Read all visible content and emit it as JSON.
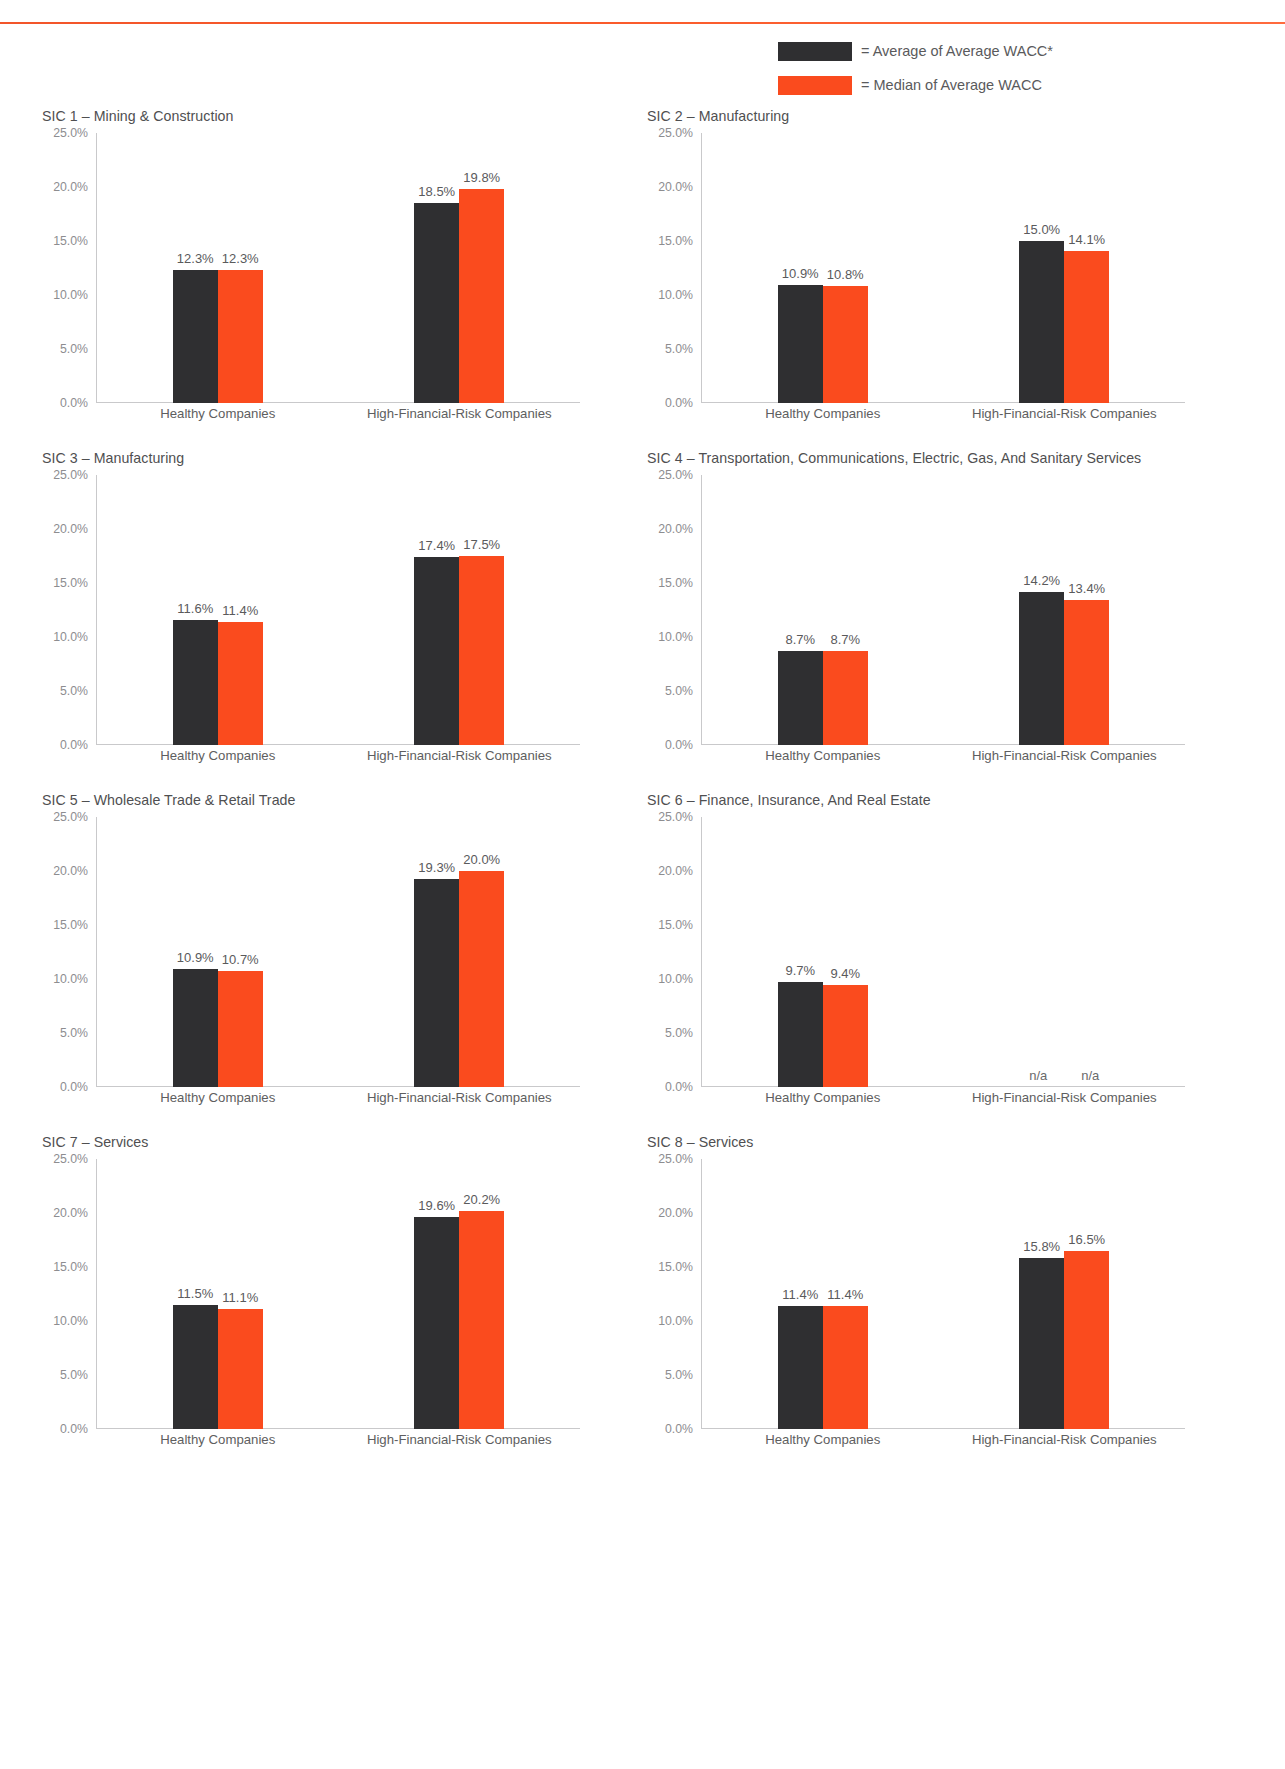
{
  "legend": {
    "items": [
      {
        "swatch": "dark",
        "color": "#2f2f31",
        "label": "= Average of Average WACC*"
      },
      {
        "swatch": "orange",
        "color": "#fa4b1e",
        "label": "= Median of Average WACC"
      }
    ]
  },
  "axis": {
    "yticks": [
      "25.0%",
      "20.0%",
      "15.0%",
      "10.0%",
      "5.0%",
      "0.0%"
    ],
    "ymax": 25.0,
    "ymin": 0.0,
    "categories": [
      "Healthy Companies",
      "High-Financial-Risk Companies"
    ]
  },
  "chart_data": [
    {
      "type": "bar",
      "title": "SIC 1 – Mining & Construction",
      "xlabel": "",
      "ylabel": "",
      "ylim": [
        0,
        25
      ],
      "categories": [
        "Healthy Companies",
        "High-Financial-Risk Companies"
      ],
      "series": [
        {
          "name": "Average of Average WACC*",
          "color": "#2f2f31",
          "values": [
            12.3,
            18.5
          ],
          "labels": [
            "12.3%",
            "18.5%"
          ]
        },
        {
          "name": "Median of Average WACC",
          "color": "#fa4b1e",
          "values": [
            12.3,
            19.8
          ],
          "labels": [
            "12.3%",
            "19.8%"
          ]
        }
      ]
    },
    {
      "type": "bar",
      "title": "SIC 2 – Manufacturing",
      "xlabel": "",
      "ylabel": "",
      "ylim": [
        0,
        25
      ],
      "categories": [
        "Healthy Companies",
        "High-Financial-Risk Companies"
      ],
      "series": [
        {
          "name": "Average of Average WACC*",
          "color": "#2f2f31",
          "values": [
            10.9,
            15.0
          ],
          "labels": [
            "10.9%",
            "15.0%"
          ]
        },
        {
          "name": "Median of Average WACC",
          "color": "#fa4b1e",
          "values": [
            10.8,
            14.1
          ],
          "labels": [
            "10.8%",
            "14.1%"
          ]
        }
      ]
    },
    {
      "type": "bar",
      "title": "SIC 3 – Manufacturing",
      "xlabel": "",
      "ylabel": "",
      "ylim": [
        0,
        25
      ],
      "categories": [
        "Healthy Companies",
        "High-Financial-Risk Companies"
      ],
      "series": [
        {
          "name": "Average of Average WACC*",
          "color": "#2f2f31",
          "values": [
            11.6,
            17.4
          ],
          "labels": [
            "11.6%",
            "17.4%"
          ]
        },
        {
          "name": "Median of Average WACC",
          "color": "#fa4b1e",
          "values": [
            11.4,
            17.5
          ],
          "labels": [
            "11.4%",
            "17.5%"
          ]
        }
      ]
    },
    {
      "type": "bar",
      "title": "SIC 4 – Transportation, Communications, Electric, Gas, And Sanitary Services",
      "xlabel": "",
      "ylabel": "",
      "ylim": [
        0,
        25
      ],
      "categories": [
        "Healthy Companies",
        "High-Financial-Risk Companies"
      ],
      "series": [
        {
          "name": "Average of Average WACC*",
          "color": "#2f2f31",
          "values": [
            8.7,
            14.2
          ],
          "labels": [
            "8.7%",
            "14.2%"
          ]
        },
        {
          "name": "Median of Average WACC",
          "color": "#fa4b1e",
          "values": [
            8.7,
            13.4
          ],
          "labels": [
            "8.7%",
            "13.4%"
          ]
        }
      ]
    },
    {
      "type": "bar",
      "title": "SIC 5 – Wholesale Trade & Retail Trade",
      "xlabel": "",
      "ylabel": "",
      "ylim": [
        0,
        25
      ],
      "categories": [
        "Healthy Companies",
        "High-Financial-Risk Companies"
      ],
      "series": [
        {
          "name": "Average of Average WACC*",
          "color": "#2f2f31",
          "values": [
            10.9,
            19.3
          ],
          "labels": [
            "10.9%",
            "19.3%"
          ]
        },
        {
          "name": "Median of Average WACC",
          "color": "#fa4b1e",
          "values": [
            10.7,
            20.0
          ],
          "labels": [
            "10.7%",
            "20.0%"
          ]
        }
      ]
    },
    {
      "type": "bar",
      "title": "SIC 6 – Finance, Insurance, And Real Estate",
      "xlabel": "",
      "ylabel": "",
      "ylim": [
        0,
        25
      ],
      "categories": [
        "Healthy Companies",
        "High-Financial-Risk Companies"
      ],
      "series": [
        {
          "name": "Average of Average WACC*",
          "color": "#2f2f31",
          "values": [
            9.7,
            null
          ],
          "labels": [
            "9.7%",
            "n/a"
          ]
        },
        {
          "name": "Median of Average WACC",
          "color": "#fa4b1e",
          "values": [
            9.4,
            null
          ],
          "labels": [
            "9.4%",
            "n/a"
          ]
        }
      ]
    },
    {
      "type": "bar",
      "title": "SIC 7 – Services",
      "xlabel": "",
      "ylabel": "",
      "ylim": [
        0,
        25
      ],
      "categories": [
        "Healthy Companies",
        "High-Financial-Risk Companies"
      ],
      "series": [
        {
          "name": "Average of Average WACC*",
          "color": "#2f2f31",
          "values": [
            11.5,
            19.6
          ],
          "labels": [
            "11.5%",
            "19.6%"
          ]
        },
        {
          "name": "Median of Average WACC",
          "color": "#fa4b1e",
          "values": [
            11.1,
            20.2
          ],
          "labels": [
            "11.1%",
            "20.2%"
          ]
        }
      ]
    },
    {
      "type": "bar",
      "title": "SIC 8 – Services",
      "xlabel": "",
      "ylabel": "",
      "ylim": [
        0,
        25
      ],
      "categories": [
        "Healthy Companies",
        "High-Financial-Risk Companies"
      ],
      "series": [
        {
          "name": "Average of Average WACC*",
          "color": "#2f2f31",
          "values": [
            11.4,
            15.8
          ],
          "labels": [
            "11.4%",
            "15.8%"
          ]
        },
        {
          "name": "Median of Average WACC",
          "color": "#fa4b1e",
          "values": [
            11.4,
            16.5
          ],
          "labels": [
            "11.4%",
            "16.5%"
          ]
        }
      ]
    }
  ]
}
